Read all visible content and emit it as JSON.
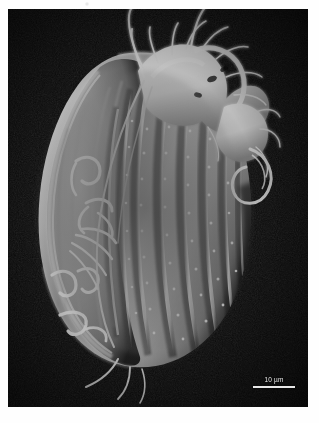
{
  "figure": {
    "kind": "scanning-electron-micrograph",
    "background_color": "#060606",
    "border_color": "#ffffff",
    "specimen_color": "#f2f2f2"
  },
  "scale_bar": {
    "label": "10 µm",
    "value": 10,
    "unit": "µm",
    "bar_color": "#e7e7e7",
    "position": "bottom-right"
  },
  "structures": {
    "body_label": "cell-body",
    "ridges_label": "longitudinal-ridges",
    "ridge_count": 9,
    "cilia_label": "adoral-membranelles",
    "cirri_label": "marginal-cirri",
    "loop_label": "caudal-loop"
  }
}
